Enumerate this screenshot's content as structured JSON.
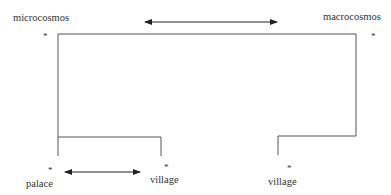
{
  "labels": {
    "top_left": "microcosmos",
    "top_right": "macrocosmos",
    "bottom_left": "palace",
    "bottom_middle": "village",
    "bottom_right": "village"
  },
  "markers": {
    "star": "*"
  },
  "colors": {
    "line": "#555555",
    "text": "#333333"
  }
}
